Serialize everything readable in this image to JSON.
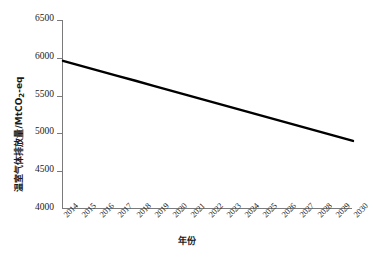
{
  "chart_data": {
    "type": "line",
    "title": "",
    "subtitle": "",
    "xlabel": "年份",
    "ylabel": "温室气体排放量/MtCO2-eq",
    "ylabel_main": "温室气体排放量/MtCO",
    "ylabel_sub": "2",
    "ylabel_tail": "-eq",
    "x": [
      2014,
      2015,
      2016,
      2017,
      2018,
      2019,
      2020,
      2021,
      2022,
      2023,
      2024,
      2025,
      2026,
      2027,
      2028,
      2029,
      2030
    ],
    "categories": [
      "2014",
      "2015",
      "2016",
      "2017",
      "2018",
      "2019",
      "2020",
      "2021",
      "2022",
      "2023",
      "2024",
      "2025",
      "2026",
      "2027",
      "2028",
      "2029",
      "2030"
    ],
    "values": [
      5960,
      5894,
      5828,
      5762,
      5696,
      5629,
      5563,
      5497,
      5431,
      5365,
      5298,
      5232,
      5166,
      5100,
      5034,
      4966,
      4900
    ],
    "series": [
      {
        "name": "温室气体排放量",
        "values": [
          5960,
          5894,
          5828,
          5762,
          5696,
          5629,
          5563,
          5497,
          5431,
          5365,
          5298,
          5232,
          5166,
          5100,
          5034,
          4966,
          4900
        ],
        "color": "#000000",
        "line_width": 2.4,
        "marker": "none"
      }
    ],
    "xlim": [
      2014,
      2030
    ],
    "ylim": [
      4000,
      6500
    ],
    "yticks": [
      4000,
      4500,
      5000,
      5500,
      6000,
      6500
    ],
    "ytick_labels": [
      "4000",
      "4500",
      "5000",
      "5500",
      "6000",
      "6500"
    ],
    "xticks": [
      2014,
      2015,
      2016,
      2017,
      2018,
      2019,
      2020,
      2021,
      2022,
      2023,
      2024,
      2025,
      2026,
      2027,
      2028,
      2029,
      2030
    ],
    "xtick_labels": [
      "2014",
      "2015",
      "2016",
      "2017",
      "2018",
      "2019",
      "2020",
      "2021",
      "2022",
      "2023",
      "2024",
      "2025",
      "2026",
      "2027",
      "2028",
      "2029",
      "2030"
    ],
    "xtick_rotation": -45,
    "grid": false,
    "legend": false,
    "legend_position": "none",
    "axis_color": "#7a7a7a",
    "background_color": "#ffffff",
    "annotations": []
  }
}
